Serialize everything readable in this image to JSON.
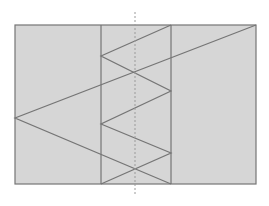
{
  "diagram": {
    "width": 269,
    "height": 206,
    "colors": {
      "fill": "#d6d6d6",
      "stroke": "#757575",
      "axis": "#9a9a9a"
    },
    "rectangle": {
      "x": 15,
      "y": 25,
      "w": 241,
      "h": 159
    },
    "band_lines": [
      {
        "x1": 101,
        "y1": 25,
        "x2": 101,
        "y2": 184
      },
      {
        "x1": 171,
        "y1": 25,
        "x2": 171,
        "y2": 184
      }
    ],
    "axis": {
      "x1": 135,
      "y1": 12,
      "x2": 135,
      "y2": 194
    },
    "zigzag": [
      [
        171,
        25
      ],
      [
        101,
        56
      ],
      [
        171,
        91
      ],
      [
        101,
        124
      ],
      [
        171,
        153
      ],
      [
        101,
        184
      ]
    ],
    "outer_ray": [
      [
        256,
        25
      ],
      [
        15,
        118
      ],
      [
        171,
        184
      ]
    ]
  }
}
